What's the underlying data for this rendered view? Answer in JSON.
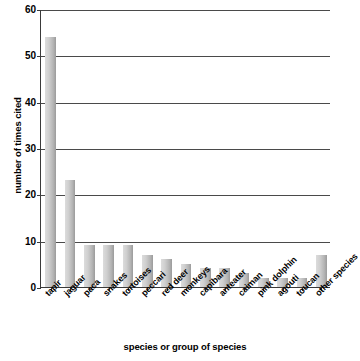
{
  "chart_data": {
    "type": "bar",
    "title": "",
    "xlabel": "species or group of species",
    "ylabel": "number of times cited",
    "ylim": [
      0,
      60
    ],
    "ytick_step": 10,
    "yticks": [
      0,
      10,
      20,
      30,
      40,
      50,
      60
    ],
    "grid": true,
    "grid_axis": "y",
    "legend": "none",
    "bar_color": "#c8c8c8",
    "axis_color": "#3a3a3a",
    "categories": [
      "tapir",
      "jaguar",
      "paca",
      "snakes",
      "tortoises",
      "peccari",
      "red deer",
      "monkeys",
      "capibara",
      "anteater",
      "caiman",
      "pink dolphin",
      "agouti",
      "toucan",
      "other species"
    ],
    "values": [
      54,
      23,
      9,
      9,
      9,
      7,
      6,
      5,
      4,
      4,
      3,
      2,
      2,
      2,
      7
    ]
  }
}
